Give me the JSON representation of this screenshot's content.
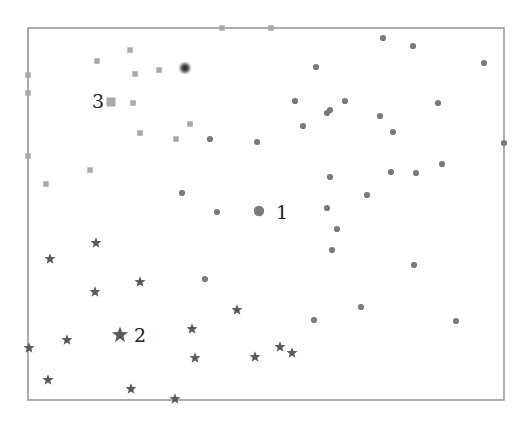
{
  "chart_data": {
    "type": "scatter",
    "title": "",
    "xlabel": "",
    "ylabel": "",
    "grid": false,
    "legend": null,
    "frame": {
      "x0": 28,
      "y0": 28,
      "x1": 504,
      "y1": 400
    },
    "colors": {
      "squares": "#a9a9a9",
      "circles": "#7a7a7a",
      "stars": "#5a5a5a",
      "frame": "#8a8a8a",
      "blur_dot": "#333333"
    },
    "series": [
      {
        "name": "cluster-3-squares",
        "marker": "square",
        "points": [
          [
            222,
            28
          ],
          [
            271,
            28
          ],
          [
            28,
            75
          ],
          [
            28,
            93
          ],
          [
            97,
            61
          ],
          [
            130,
            50
          ],
          [
            135,
            74
          ],
          [
            159,
            70
          ],
          [
            133,
            103
          ],
          [
            140,
            133
          ],
          [
            176,
            139
          ],
          [
            190,
            124
          ],
          [
            28,
            156
          ],
          [
            90,
            170
          ],
          [
            46,
            184
          ]
        ]
      },
      {
        "name": "cluster-1-circles",
        "marker": "circle",
        "points": [
          [
            383,
            38
          ],
          [
            413,
            46
          ],
          [
            316,
            67
          ],
          [
            484,
            63
          ],
          [
            295,
            101
          ],
          [
            327,
            113
          ],
          [
            330,
            110
          ],
          [
            345,
            101
          ],
          [
            380,
            116
          ],
          [
            303,
            126
          ],
          [
            393,
            132
          ],
          [
            438,
            103
          ],
          [
            504,
            143
          ],
          [
            210,
            139
          ],
          [
            257,
            142
          ],
          [
            330,
            177
          ],
          [
            391,
            172
          ],
          [
            416,
            173
          ],
          [
            442,
            164
          ],
          [
            367,
            195
          ],
          [
            182,
            193
          ],
          [
            217,
            212
          ],
          [
            327,
            208
          ],
          [
            337,
            229
          ],
          [
            332,
            250
          ],
          [
            414,
            265
          ],
          [
            205,
            279
          ],
          [
            361,
            307
          ],
          [
            314,
            320
          ],
          [
            456,
            321
          ]
        ]
      },
      {
        "name": "cluster-2-stars",
        "marker": "star",
        "points": [
          [
            96,
            243
          ],
          [
            50,
            259
          ],
          [
            95,
            292
          ],
          [
            140,
            282
          ],
          [
            237,
            310
          ],
          [
            192,
            329
          ],
          [
            67,
            340
          ],
          [
            29,
            348
          ],
          [
            195,
            358
          ],
          [
            255,
            357
          ],
          [
            280,
            347
          ],
          [
            292,
            353
          ],
          [
            48,
            380
          ],
          [
            131,
            389
          ],
          [
            175,
            399
          ]
        ]
      }
    ],
    "centroids": [
      {
        "label": "1",
        "marker": "circle",
        "x": 259,
        "y": 211,
        "label_x": 276,
        "label_y": 219
      },
      {
        "label": "2",
        "marker": "star",
        "x": 120,
        "y": 335,
        "label_x": 134,
        "label_y": 342
      },
      {
        "label": "3",
        "marker": "square",
        "x": 111,
        "y": 102,
        "label_x": 92,
        "label_y": 108
      }
    ],
    "annotations": [
      {
        "type": "blurred-dot",
        "x": 185,
        "y": 68
      }
    ]
  }
}
